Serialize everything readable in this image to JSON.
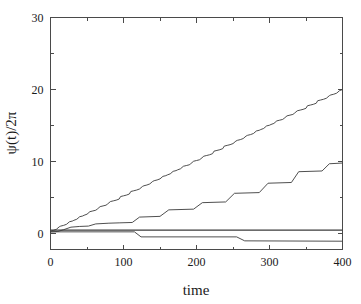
{
  "chart_data": {
    "type": "line",
    "title": "",
    "xlabel": "time",
    "ylabel": "ψ(t)/2π",
    "xlim": [
      0,
      400
    ],
    "ylim": [
      -2.2,
      30
    ],
    "xticks": [
      0,
      100,
      200,
      300,
      400
    ],
    "xtick_labels": [
      "0",
      "100",
      "200",
      "300",
      "400"
    ],
    "xticks_minor": [
      50,
      150,
      250,
      350
    ],
    "yticks": [
      0,
      10,
      20,
      30
    ],
    "ytick_labels": [
      "0",
      "10",
      "20",
      "30"
    ],
    "yticks_minor": [
      5,
      15,
      25
    ],
    "grid": false,
    "legend": "none",
    "series": [
      {
        "name": "fast-staircase",
        "style": "staircase",
        "x": [
          0,
          4,
          8,
          12,
          14,
          18,
          22,
          26,
          30,
          32,
          36,
          40,
          44,
          46,
          50,
          54,
          58,
          62,
          64,
          68,
          72,
          76,
          78,
          82,
          86,
          90,
          94,
          96,
          100,
          104,
          108,
          110,
          114,
          118,
          122,
          126,
          128,
          132,
          136,
          140,
          142,
          146,
          150,
          154,
          158,
          160,
          164,
          168,
          172,
          174,
          178,
          182,
          186,
          190,
          192,
          196,
          200,
          204,
          206,
          210,
          214,
          218,
          222,
          224,
          228,
          232,
          236,
          238,
          242,
          246,
          250,
          254,
          256,
          260,
          264,
          268,
          270,
          274,
          278,
          282,
          286,
          288,
          292,
          296,
          300,
          302,
          306,
          310,
          314,
          318,
          320,
          324,
          328,
          332,
          334,
          338,
          342,
          346,
          350,
          352,
          356,
          360,
          364,
          366,
          370,
          374,
          378,
          382,
          384,
          388,
          392,
          396,
          400
        ],
        "y": [
          0.35,
          0.45,
          0.6,
          0.95,
          1.05,
          1.15,
          1.3,
          1.65,
          1.75,
          1.85,
          2.0,
          2.35,
          2.45,
          2.55,
          2.7,
          3.05,
          3.15,
          3.25,
          3.4,
          3.75,
          3.85,
          3.95,
          4.1,
          4.45,
          4.55,
          4.65,
          4.8,
          5.15,
          5.25,
          5.35,
          5.5,
          5.85,
          5.95,
          6.05,
          6.2,
          6.55,
          6.65,
          6.75,
          6.9,
          7.25,
          7.35,
          7.45,
          7.6,
          7.95,
          8.05,
          8.15,
          8.3,
          8.65,
          8.75,
          8.85,
          9.0,
          9.35,
          9.45,
          9.55,
          9.7,
          10.05,
          10.15,
          10.25,
          10.4,
          10.75,
          10.85,
          10.95,
          11.1,
          11.45,
          11.55,
          11.65,
          11.8,
          12.15,
          12.25,
          12.35,
          12.5,
          12.85,
          12.95,
          13.05,
          13.2,
          13.55,
          13.65,
          13.75,
          13.9,
          14.25,
          14.35,
          14.45,
          14.6,
          14.95,
          15.05,
          15.15,
          15.3,
          15.65,
          15.75,
          15.85,
          16.0,
          16.35,
          16.45,
          16.55,
          16.7,
          17.05,
          17.15,
          17.25,
          17.4,
          17.75,
          17.85,
          17.95,
          18.1,
          18.45,
          18.55,
          18.65,
          18.8,
          19.15,
          19.25,
          19.35,
          19.5,
          19.85,
          20.0
        ]
      },
      {
        "name": "slow-staircase",
        "style": "staircase-plateau",
        "x": [
          0,
          10,
          18,
          28,
          40,
          52,
          62,
          80,
          95,
          112,
          122,
          150,
          162,
          196,
          208,
          240,
          252,
          286,
          298,
          330,
          340,
          372,
          382,
          400
        ],
        "y": [
          0.25,
          0.3,
          0.55,
          0.9,
          1.0,
          1.05,
          1.35,
          1.45,
          1.5,
          1.55,
          2.3,
          2.4,
          3.3,
          3.4,
          4.3,
          4.4,
          5.6,
          5.7,
          7.0,
          7.1,
          8.6,
          8.7,
          9.7,
          9.8
        ]
      },
      {
        "name": "flat-line",
        "style": "flat",
        "x": [
          0,
          400
        ],
        "y": [
          0.5,
          0.5
        ]
      },
      {
        "name": "descending-step",
        "style": "step-down",
        "x": [
          0,
          115,
          124,
          255,
          266,
          400
        ],
        "y": [
          0.25,
          0.25,
          -0.45,
          -0.45,
          -1.0,
          -1.05
        ]
      }
    ],
    "annotations": []
  },
  "axes": {
    "x_label": "time",
    "y_label": "ψ(t)/2π"
  },
  "colors": {
    "curve": "#3b3b3b",
    "frame": "#4a4a4a",
    "text": "#1a1a1a",
    "background": "#ffffff"
  }
}
